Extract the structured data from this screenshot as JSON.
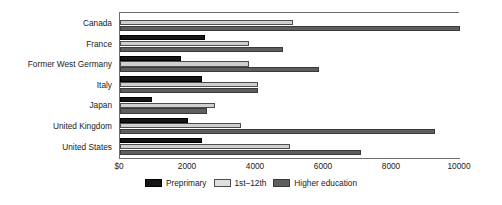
{
  "chart_data": {
    "type": "bar",
    "orientation": "horizontal",
    "title": "",
    "subtitle": "",
    "xlabel": "",
    "ylabel": "",
    "xlim": [
      0,
      10000
    ],
    "xticks": [
      0,
      2000,
      4000,
      6000,
      8000,
      10000
    ],
    "xtick_labels": [
      "$0",
      "2000",
      "4000",
      "6000",
      "8000",
      "10000"
    ],
    "grid": false,
    "legend_position": "bottom-center",
    "categories": [
      "Canada",
      "France",
      "Former West Germany",
      "Italy",
      "Japan",
      "United Kingdom",
      "United States"
    ],
    "series": [
      {
        "name": "Preprimary",
        "color": "#151515",
        "values": [
          0,
          2500,
          1800,
          2400,
          950,
          2000,
          2400
        ]
      },
      {
        "name": "1st–12th",
        "color": "#cfcfcf",
        "values": [
          5100,
          3800,
          3800,
          4050,
          2800,
          3550,
          5000
        ]
      },
      {
        "name": "Higher education",
        "color": "#5e5e5e",
        "values": [
          10000,
          4800,
          5850,
          4050,
          2550,
          9250,
          7100
        ]
      }
    ]
  },
  "axis": {
    "ticks": [
      {
        "label": "$0",
        "value": 0
      },
      {
        "label": "2000",
        "value": 2000
      },
      {
        "label": "4000",
        "value": 4000
      },
      {
        "label": "6000",
        "value": 6000
      },
      {
        "label": "8000",
        "value": 8000
      },
      {
        "label": "10000",
        "value": 10000
      }
    ]
  },
  "legend": {
    "items": [
      {
        "label": "Preprimary",
        "color": "#151515"
      },
      {
        "label": "1st–12th",
        "color": "#cfcfcf"
      },
      {
        "label": "Higher education",
        "color": "#5e5e5e"
      }
    ]
  },
  "colors": {
    "background": "#ffffff",
    "axis": "#6e6e6e",
    "text": "#1a1a1a",
    "preprimary": "#151515",
    "secondary": "#cfcfcf",
    "higher": "#5e5e5e"
  }
}
